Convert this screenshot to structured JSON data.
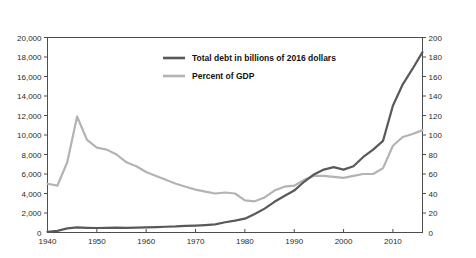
{
  "header": {
    "left_axis_title": "Billions of 2016 U.S. dollars",
    "right_axis_title": "Percent of GDP"
  },
  "legend": {
    "items": [
      {
        "label": "Total debt in billions of 2016 dollars",
        "color": "#595959"
      },
      {
        "label": "Percent of GDP",
        "color": "#b3b3b3"
      }
    ]
  },
  "axes": {
    "left_ticks": [
      "0",
      "2,000",
      "4,000",
      "6,000",
      "8,000",
      "10,000",
      "12,000",
      "14,000",
      "16,000",
      "18,000",
      "20,000"
    ],
    "right_ticks": [
      "0",
      "20",
      "40",
      "60",
      "80",
      "100",
      "120",
      "140",
      "160",
      "180",
      "200"
    ],
    "x_ticks": [
      "1940",
      "1950",
      "1960",
      "1970",
      "1980",
      "1990",
      "2000",
      "2010"
    ]
  },
  "chart_data": {
    "type": "line",
    "title": "",
    "xlabel": "",
    "ylabel": "Billions of 2016 U.S. dollars",
    "y2label": "Percent of GDP",
    "xlim": [
      1940,
      2016
    ],
    "ylim": [
      0,
      20000
    ],
    "y2lim": [
      0,
      200
    ],
    "grid": false,
    "legend_position": "upper-center",
    "x": [
      1940,
      1942,
      1944,
      1946,
      1948,
      1950,
      1952,
      1954,
      1956,
      1958,
      1960,
      1962,
      1964,
      1966,
      1968,
      1970,
      1972,
      1974,
      1976,
      1978,
      1980,
      1982,
      1984,
      1986,
      1988,
      1990,
      1992,
      1994,
      1996,
      1998,
      2000,
      2002,
      2004,
      2006,
      2008,
      2010,
      2012,
      2014,
      2016
    ],
    "series": [
      {
        "name": "Total debt in billions of 2016 dollars",
        "axis": "left",
        "color": "#595959",
        "values": [
          60,
          170,
          420,
          520,
          480,
          460,
          470,
          500,
          480,
          500,
          520,
          560,
          590,
          620,
          680,
          710,
          760,
          830,
          1050,
          1220,
          1420,
          1900,
          2450,
          3150,
          3750,
          4300,
          5200,
          5950,
          6450,
          6700,
          6450,
          6800,
          7750,
          8500,
          9400,
          13000,
          15200,
          16800,
          18500
        ]
      },
      {
        "name": "Percent of GDP",
        "axis": "right",
        "color": "#b3b3b3",
        "values": [
          50,
          48,
          72,
          119,
          95,
          87,
          85,
          80,
          72,
          68,
          62,
          58,
          54,
          50,
          47,
          44,
          42,
          40,
          41,
          40,
          33,
          32,
          36,
          43,
          47,
          48,
          54,
          58,
          58,
          57,
          56,
          58,
          60,
          60,
          66,
          89,
          98,
          101,
          105
        ]
      }
    ]
  }
}
